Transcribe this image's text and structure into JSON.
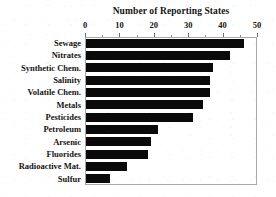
{
  "chart_data": {
    "type": "bar",
    "orientation": "horizontal",
    "title": "Number of Reporting States",
    "xlabel": "",
    "ylabel": "",
    "xlim": [
      0,
      50
    ],
    "grid": false,
    "legend": null,
    "axis_position": "top",
    "bar_color": "#0a0a0a",
    "frame_color": "#a8a8a8",
    "xticks": [
      0,
      10,
      20,
      30,
      40,
      50
    ],
    "xtick_labels": [
      "0",
      "10",
      "20",
      "30",
      "40",
      "50"
    ],
    "minor_tick_interval": 5,
    "categories": [
      "Sewage",
      "Nitrates",
      "Synthetic Chem.",
      "Salinity",
      "Volatile Chem.",
      "Metals",
      "Pesticides",
      "Petroleum",
      "Arsenic",
      "Fluorides",
      "Radioactive Mat.",
      "Sulfur"
    ],
    "values": [
      46,
      42,
      37,
      36,
      36,
      34,
      31,
      21,
      19,
      18,
      12,
      7
    ]
  }
}
